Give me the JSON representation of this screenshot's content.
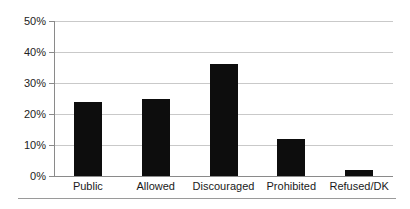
{
  "chart_data": {
    "type": "bar",
    "title": "",
    "xlabel": "",
    "ylabel": "",
    "categories": [
      "Public",
      "Allowed",
      "Discouraged",
      "Prohibited",
      "Refused/DK"
    ],
    "values": [
      24,
      25,
      36,
      12,
      2
    ],
    "value_labels": [
      "24%",
      "25%",
      "36%",
      "12%",
      "2%"
    ],
    "ylim": [
      0,
      50
    ],
    "ytick_values": [
      0,
      10,
      20,
      30,
      40,
      50
    ],
    "ytick_labels": [
      "0%",
      "10%",
      "20%",
      "30%",
      "40%",
      "50%"
    ],
    "grid": true,
    "legend": false,
    "legend_position": "none",
    "series": [
      {
        "name": "",
        "values": [
          24,
          25,
          36,
          12,
          2
        ]
      }
    ],
    "colors": {
      "bar": "#0d0d0d",
      "gridline": "#c9c9c9",
      "axis": "#8a8a8a",
      "background": "#ffffff",
      "text": "#1a1a1a"
    }
  }
}
